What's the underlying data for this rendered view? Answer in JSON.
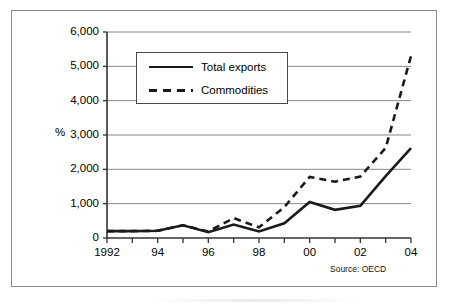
{
  "chart_data": {
    "type": "line",
    "title": "",
    "subtitle": "",
    "xlabel": "",
    "ylabel": "%",
    "ylim": [
      0,
      6000
    ],
    "xlim": [
      1992,
      2004
    ],
    "grid": true,
    "grid_axis": "y",
    "legend_position": "upper-left-inside",
    "source_note": "Source: OECD",
    "x": [
      1992,
      1993,
      1994,
      1995,
      1996,
      1997,
      1998,
      1999,
      2000,
      2001,
      2002,
      2003,
      2004
    ],
    "xtick_values": [
      1992,
      1994,
      1996,
      1998,
      2000,
      2002,
      2004
    ],
    "xtick_labels": [
      "1992",
      "94",
      "96",
      "98",
      "00",
      "02",
      "04"
    ],
    "ytick_values": [
      0,
      1000,
      2000,
      3000,
      4000,
      5000,
      6000
    ],
    "ytick_labels": [
      "0",
      "1,000",
      "2,000",
      "3,000",
      "4,000",
      "5,000",
      "6,000"
    ],
    "series": [
      {
        "name": "Total exports",
        "style": "solid",
        "color": "#1a1a1a",
        "values": [
          200,
          200,
          210,
          370,
          170,
          390,
          190,
          430,
          1050,
          820,
          940,
          1800,
          2620
        ]
      },
      {
        "name": "Commodities",
        "style": "dashed",
        "color": "#1a1a1a",
        "values": [
          200,
          200,
          210,
          370,
          190,
          580,
          310,
          900,
          1780,
          1640,
          1790,
          2620,
          5300
        ]
      }
    ]
  },
  "axes": {
    "y_axis_title": "%",
    "source": "Source: OECD"
  },
  "legend": {
    "entries": [
      {
        "label": "Total exports",
        "style": "solid"
      },
      {
        "label": "Commodities",
        "style": "dashed"
      }
    ]
  }
}
